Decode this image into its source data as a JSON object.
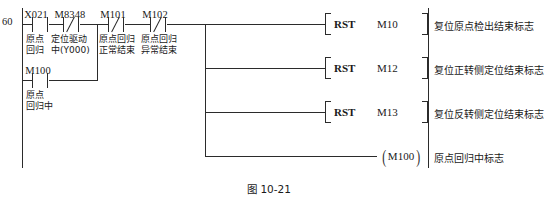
{
  "figure": {
    "caption": "图 10-21"
  },
  "ladder": {
    "step_number": "60",
    "rungs": [
      {
        "id": "rung-1",
        "comment": "复位原点检出结束标志",
        "output": {
          "kind": "instruction",
          "opcode": "RST",
          "operand": "M10"
        }
      },
      {
        "id": "rung-2",
        "comment": "复位正转侧定位结束标志",
        "output": {
          "kind": "instruction",
          "opcode": "RST",
          "operand": "M12"
        }
      },
      {
        "id": "rung-3",
        "comment": "复位反转侧定位结束标志",
        "output": {
          "kind": "instruction",
          "opcode": "RST",
          "operand": "M13"
        }
      },
      {
        "id": "rung-4",
        "comment": "原点回归中标志",
        "output": {
          "kind": "coil",
          "operand": "M100"
        }
      }
    ],
    "contacts": [
      {
        "id": "contact-x021",
        "device": "X021",
        "type": "normally-open",
        "note_line1": "原点",
        "note_line2": "回归"
      },
      {
        "id": "contact-m8348",
        "device": "M8348",
        "type": "normally-closed",
        "note_line1": "定位驱动",
        "note_line2": "中(Y000)"
      },
      {
        "id": "contact-m101",
        "device": "M101",
        "type": "normally-closed",
        "note_line1": "原点回归",
        "note_line2": "正常结束"
      },
      {
        "id": "contact-m102",
        "device": "M102",
        "type": "normally-closed",
        "note_line1": "原点回归",
        "note_line2": "异常结束"
      },
      {
        "id": "contact-m100",
        "device": "M100",
        "type": "normally-open",
        "note_line1": "原点",
        "note_line2": "回归中"
      }
    ]
  },
  "colors": {
    "line": "#2b2b2b",
    "text": "#1a1a1a",
    "background": "#ffffff"
  }
}
